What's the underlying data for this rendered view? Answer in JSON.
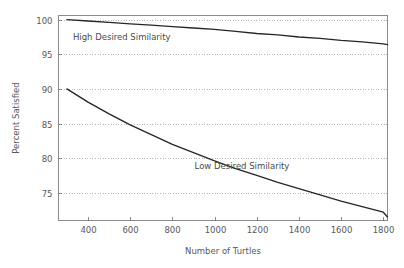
{
  "chart_data": {
    "type": "line",
    "title": "",
    "xlabel": "Number of Turtles",
    "ylabel": "Percent Satisfied",
    "xlim": [
      260,
      1820
    ],
    "ylim": [
      71.0,
      100.6
    ],
    "xticks": [
      400,
      600,
      800,
      1000,
      1200,
      1400,
      1600,
      1800
    ],
    "yticks": [
      75,
      80,
      85,
      90,
      95,
      100
    ],
    "xtick_labels": [
      "400",
      "600",
      "800",
      "1000",
      "1200",
      "1400",
      "1600",
      "1800"
    ],
    "ytick_labels": [
      "75",
      "80",
      "85",
      "90",
      "95",
      "100"
    ],
    "grid": "horizontal-dashed",
    "legend": "inline-annotations",
    "series": [
      {
        "name": "High Desired Similarity",
        "label_x": 560,
        "label_y": 97.0,
        "x": [
          300,
          400,
          500,
          600,
          700,
          800,
          900,
          1000,
          1100,
          1200,
          1300,
          1400,
          1500,
          1600,
          1700,
          1800,
          1820
        ],
        "values": [
          100.0,
          99.8,
          99.6,
          99.4,
          99.2,
          99.0,
          98.8,
          98.6,
          98.3,
          98.0,
          97.8,
          97.5,
          97.3,
          97.0,
          96.8,
          96.5,
          96.4
        ]
      },
      {
        "name": "Low Desired Similarity",
        "label_x": 1130,
        "label_y": 78.4,
        "x": [
          300,
          400,
          500,
          600,
          700,
          800,
          900,
          1000,
          1100,
          1200,
          1300,
          1400,
          1500,
          1600,
          1700,
          1800,
          1820
        ],
        "values": [
          90.0,
          88.1,
          86.4,
          84.8,
          83.4,
          82.0,
          80.8,
          79.6,
          78.5,
          77.5,
          76.5,
          75.6,
          74.7,
          73.8,
          73.0,
          72.2,
          71.5
        ]
      }
    ]
  },
  "axes": {
    "y_title": "Percent Satisfied",
    "x_title": "Number of Turtles"
  }
}
